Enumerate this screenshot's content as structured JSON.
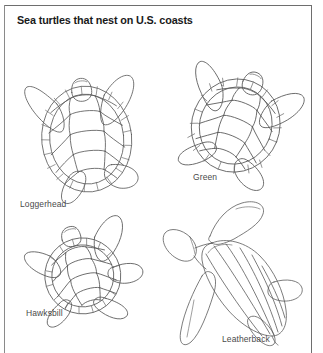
{
  "figure": {
    "title": "Sea turtles that nest on U.S. coasts",
    "background_color": "#ffffff",
    "frame_color": "#6e6e6e",
    "ink_color": "#5a5a5a",
    "label_color": "#4a4a4a"
  },
  "turtles": [
    {
      "id": "loggerhead",
      "label": "Loggerhead",
      "icon": "sea-turtle-top-view-icon",
      "shell": "oval carapace with polygonal scutes and marginal ring",
      "position": "top-left"
    },
    {
      "id": "green",
      "label": "Green",
      "icon": "sea-turtle-top-view-icon",
      "shell": "rounded carapace with polygonal scutes and marginal ring",
      "position": "top-right"
    },
    {
      "id": "hawksbill",
      "label": "Hawksbill",
      "icon": "sea-turtle-top-view-icon",
      "shell": "small carapace with overlapping scutes and serrated margin",
      "position": "bottom-left"
    },
    {
      "id": "leatherback",
      "label": "Leatherback",
      "icon": "sea-turtle-top-view-icon",
      "shell": "tapered ridged carapace without scutes",
      "position": "bottom-right"
    }
  ]
}
